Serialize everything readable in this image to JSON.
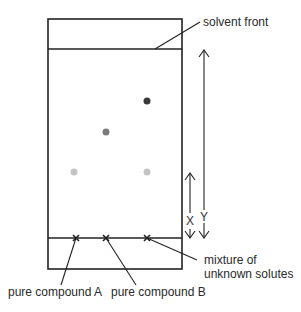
{
  "diagram": {
    "labels": {
      "solvent_front": "solvent front",
      "mixture_line1": "mixture of",
      "mixture_line2": "unknown solutes",
      "compound_a": "pure compound A",
      "compound_b": "pure compound B",
      "distance_x": "X",
      "distance_y": "Y"
    },
    "spots": [
      {
        "lane": "pure compound A",
        "shade": "light",
        "color": "#c4c4c4"
      },
      {
        "lane": "pure compound B",
        "shade": "medium",
        "color": "#7a7a7a"
      },
      {
        "lane": "mixture of unknown solutes",
        "shade": "dark",
        "color": "#3a3a3a"
      },
      {
        "lane": "mixture of unknown solutes",
        "shade": "light",
        "color": "#c4c4c4"
      }
    ],
    "baseline_marks": [
      "pure compound A",
      "pure compound B",
      "mixture of unknown solutes"
    ],
    "colors": {
      "line": "#222222",
      "text": "#2a2a2a",
      "background": "#ffffff"
    }
  }
}
